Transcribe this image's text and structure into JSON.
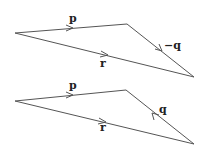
{
  "diagrams": [
    {
      "name": "triangle-top",
      "vertices": {
        "left": [
          15,
          33
        ],
        "top_right": [
          127,
          24
        ],
        "bottom_right": [
          194,
          77
        ]
      },
      "vectors": [
        {
          "label": "p",
          "from": "left",
          "to": "top_right",
          "label_pos": [
            69,
            22
          ]
        },
        {
          "label": "−q",
          "from": "top_right",
          "to": "bottom_right",
          "label_pos": [
            164,
            49
          ]
        },
        {
          "label": "r",
          "from": "left",
          "to": "bottom_right",
          "label_pos": [
            100,
            67
          ]
        }
      ]
    },
    {
      "name": "triangle-bottom",
      "vertices": {
        "left": [
          15,
          101
        ],
        "top_right": [
          126,
          90
        ],
        "bottom_right": [
          194,
          144
        ]
      },
      "vectors": [
        {
          "label": "p",
          "from": "left",
          "to": "top_right",
          "label_pos": [
            69,
            89
          ]
        },
        {
          "label": "q",
          "from": "bottom_right",
          "to": "top_right",
          "label_pos": [
            159,
            113
          ]
        },
        {
          "label": "r",
          "from": "left",
          "to": "bottom_right",
          "label_pos": [
            100,
            131
          ]
        }
      ]
    }
  ],
  "colors": {
    "line": "#555555",
    "label": "#222222",
    "background": "#ffffff"
  }
}
